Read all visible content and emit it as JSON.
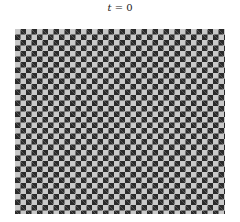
{
  "title": {
    "variable": "t",
    "equals": " = ",
    "value": "0"
  },
  "board": {
    "pattern": "checkerboard",
    "colors": {
      "dark": "#2a2a2a",
      "light": "#c8c8c8"
    },
    "approx_columns": 38,
    "approx_rows": 34
  }
}
